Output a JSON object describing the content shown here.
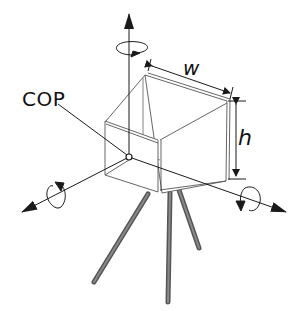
{
  "figure": {
    "labels": {
      "cop": "COP",
      "width": "w",
      "height": "h"
    },
    "colors": {
      "line": "#1a1a1a",
      "thin_line": "#555555",
      "tripod_leg": "#6a6a6a",
      "background": "#ffffff"
    }
  }
}
